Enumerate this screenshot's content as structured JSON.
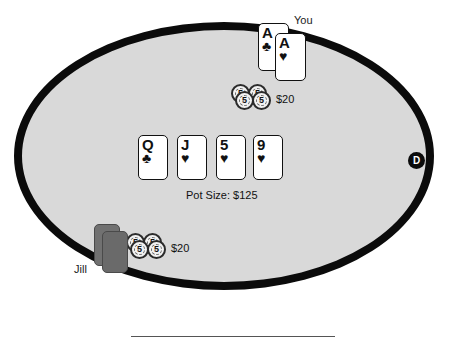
{
  "table": {
    "felt_color": "#d9d9d9",
    "border_color": "#0b0b0b",
    "background_color": "#ffffff"
  },
  "pot": {
    "label": "Pot Size: $125",
    "amount": "$125"
  },
  "dealer_button": {
    "label": "D"
  },
  "players": [
    {
      "id": "you",
      "name": "You",
      "position": "top",
      "cards_face_up": true,
      "cards": [
        {
          "rank": "A",
          "suit": "clubs",
          "suit_glyph": "♣"
        },
        {
          "rank": "A",
          "suit": "hearts",
          "suit_glyph": "♥"
        }
      ],
      "bet": {
        "amount": "$20",
        "chips": [
          {
            "value": "5"
          },
          {
            "value": "5"
          },
          {
            "value": "5"
          },
          {
            "value": "5"
          }
        ]
      }
    },
    {
      "id": "jill",
      "name": "Jill",
      "position": "bottom-left",
      "cards_face_up": false,
      "cards": [
        {
          "rank": "",
          "suit": "hidden",
          "suit_glyph": ""
        },
        {
          "rank": "",
          "suit": "hidden",
          "suit_glyph": ""
        }
      ],
      "bet": {
        "amount": "$20",
        "chips": [
          {
            "value": "5"
          },
          {
            "value": "5"
          },
          {
            "value": "5"
          },
          {
            "value": "5"
          }
        ]
      }
    }
  ],
  "community_cards": [
    {
      "rank": "Q",
      "suit": "clubs",
      "suit_glyph": "♣"
    },
    {
      "rank": "J",
      "suit": "hearts",
      "suit_glyph": "♥"
    },
    {
      "rank": "5",
      "suit": "hearts",
      "suit_glyph": "♥"
    },
    {
      "rank": "9",
      "suit": "hearts",
      "suit_glyph": "♥"
    }
  ]
}
